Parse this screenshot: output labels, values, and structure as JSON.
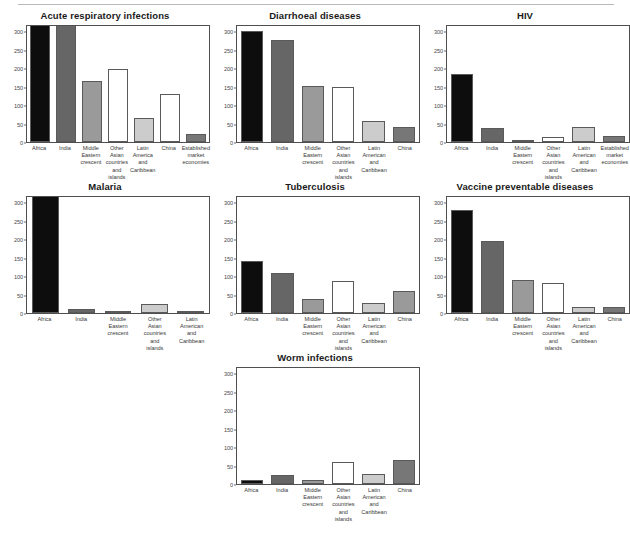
{
  "figure": {
    "title_rule": true,
    "panel_count": 7,
    "y_ticks": [
      0,
      50,
      100,
      150,
      200,
      250,
      300
    ],
    "y_axis_max": 320,
    "bar_colors": {
      "africa": "#0d0d0d",
      "india": "#666666",
      "middle_eastern": "#9a9a9a",
      "other_asian": "#ffffff",
      "latin_american": "#cccccc",
      "china": "#ffffff",
      "established": "#777777",
      "border": "#5a5a5a"
    }
  },
  "chart_data": [
    {
      "type": "bar",
      "title": "Acute respiratory infections",
      "xlabel": "",
      "ylabel": "",
      "ylim": [
        0,
        320
      ],
      "grid": false,
      "legend": "none",
      "categories": [
        "Africa",
        "India",
        "Middle Eastern crescent",
        "Other Asian countries and islands",
        "Latin America and Caribbean",
        "China",
        "Established market economies"
      ],
      "category_lines": [
        [
          "Africa"
        ],
        [
          "India"
        ],
        [
          "Middle",
          "Eastern",
          "crescent"
        ],
        [
          "Other",
          "Asian",
          "countries",
          "and",
          "islands"
        ],
        [
          "Latin",
          "America",
          "and",
          "Caribbean"
        ],
        [
          "China"
        ],
        [
          "Established",
          "market",
          "economies"
        ]
      ],
      "values": [
        318,
        318,
        165,
        199,
        64,
        129,
        22
      ],
      "colors": [
        "#0d0d0d",
        "#666666",
        "#9a9a9a",
        "#ffffff",
        "#cccccc",
        "#ffffff",
        "#777777"
      ]
    },
    {
      "type": "bar",
      "title": "Diarrhoeal diseases",
      "xlabel": "",
      "ylabel": "",
      "ylim": [
        0,
        320
      ],
      "grid": false,
      "legend": "none",
      "categories": [
        "Africa",
        "India",
        "Middle Eastern crescent",
        "Other Asian countries and islands",
        "Latin American and Caribbean",
        "China"
      ],
      "category_lines": [
        [
          "Africa"
        ],
        [
          "India"
        ],
        [
          "Middle",
          "Eastern",
          "crescent"
        ],
        [
          "Other",
          "Asian",
          "countries",
          "and",
          "islands"
        ],
        [
          "Latin",
          "American",
          "and",
          "Caribbean"
        ],
        [
          "China"
        ]
      ],
      "values": [
        302,
        276,
        153,
        148,
        57,
        41
      ],
      "colors": [
        "#0d0d0d",
        "#666666",
        "#9a9a9a",
        "#ffffff",
        "#cccccc",
        "#777777"
      ]
    },
    {
      "type": "bar",
      "title": "HIV",
      "xlabel": "",
      "ylabel": "",
      "ylim": [
        0,
        320
      ],
      "grid": false,
      "legend": "none",
      "categories": [
        "Africa",
        "India",
        "Middle Eastern crescent",
        "Other Asian countries and islands",
        "Latin American and Caribbean",
        "Established market economies"
      ],
      "category_lines": [
        [
          "Africa"
        ],
        [
          "India"
        ],
        [
          "Middle",
          "Eastern",
          "crescent"
        ],
        [
          "Other",
          "Asian",
          "countries",
          "and",
          "islands"
        ],
        [
          "Latin",
          "American",
          "and",
          "Caribbean"
        ],
        [
          "Established",
          "market",
          "economies"
        ]
      ],
      "values": [
        185,
        38,
        4,
        13,
        41,
        15
      ],
      "colors": [
        "#0d0d0d",
        "#666666",
        "#9a9a9a",
        "#ffffff",
        "#cccccc",
        "#777777"
      ]
    },
    {
      "type": "bar",
      "title": "Malaria",
      "xlabel": "",
      "ylabel": "",
      "ylim": [
        0,
        320
      ],
      "grid": false,
      "legend": "none",
      "categories": [
        "Africa",
        "India",
        "Middle Eastern crescent",
        "Other Asian countries and islands",
        "Latin American and Caribbean"
      ],
      "category_lines": [
        [
          "Africa"
        ],
        [
          "India"
        ],
        [
          "Middle",
          "Eastern",
          "crescent"
        ],
        [
          "Other",
          "Asian",
          "countries",
          "and",
          "islands"
        ],
        [
          "Latin",
          "American",
          "and",
          "Caribbean"
        ]
      ],
      "values": [
        318,
        10,
        3,
        24,
        5
      ],
      "colors": [
        "#0d0d0d",
        "#666666",
        "#9a9a9a",
        "#cccccc",
        "#777777"
      ]
    },
    {
      "type": "bar",
      "title": "Tuberculosis",
      "xlabel": "",
      "ylabel": "",
      "ylim": [
        0,
        320
      ],
      "grid": false,
      "legend": "none",
      "categories": [
        "Africa",
        "India",
        "Middle Eastern crescent",
        "Other Asian countries and islands",
        "Latin American and Caribbean",
        "China"
      ],
      "category_lines": [
        [
          "Africa"
        ],
        [
          "India"
        ],
        [
          "Middle",
          "Eastern",
          "crescent"
        ],
        [
          "Other",
          "Asian",
          "countries",
          "and",
          "islands"
        ],
        [
          "Latin",
          "American",
          "and",
          "Caribbean"
        ],
        [
          "China"
        ]
      ],
      "values": [
        142,
        109,
        39,
        87,
        27,
        59
      ],
      "colors": [
        "#0d0d0d",
        "#666666",
        "#9a9a9a",
        "#ffffff",
        "#cccccc",
        "#9a9a9a"
      ]
    },
    {
      "type": "bar",
      "title": "Vaccine preventable diseases",
      "xlabel": "",
      "ylabel": "",
      "ylim": [
        0,
        320
      ],
      "grid": false,
      "legend": "none",
      "categories": [
        "Africa",
        "India",
        "Middle Eastern crescent",
        "Other Asian countries and islands",
        "Latin American and Caribbean",
        "China"
      ],
      "category_lines": [
        [
          "Africa"
        ],
        [
          "India"
        ],
        [
          "Middle",
          "Eastern",
          "crescent"
        ],
        [
          "Other",
          "Asian",
          "countries",
          "and",
          "islands"
        ],
        [
          "Latin",
          "American",
          "and",
          "Caribbean"
        ],
        [
          "China"
        ]
      ],
      "values": [
        280,
        195,
        89,
        81,
        15,
        17
      ],
      "colors": [
        "#0d0d0d",
        "#666666",
        "#9a9a9a",
        "#ffffff",
        "#cccccc",
        "#777777"
      ]
    },
    {
      "type": "bar",
      "title": "Worm infections",
      "xlabel": "",
      "ylabel": "",
      "ylim": [
        0,
        320
      ],
      "grid": false,
      "legend": "none",
      "categories": [
        "Africa",
        "India",
        "Middle Eastern crescent",
        "Other Asian countries and islands",
        "Latin American and Caribbean",
        "China"
      ],
      "category_lines": [
        [
          "Africa"
        ],
        [
          "India"
        ],
        [
          "Middle",
          "Eastern",
          "crescent"
        ],
        [
          "Other",
          "Asian",
          "countries",
          "and",
          "islands"
        ],
        [
          "Latin",
          "American",
          "and",
          "Caribbean"
        ],
        [
          "China"
        ]
      ],
      "values": [
        11,
        24,
        10,
        60,
        28,
        64
      ],
      "colors": [
        "#0d0d0d",
        "#666666",
        "#9a9a9a",
        "#ffffff",
        "#cccccc",
        "#777777"
      ]
    }
  ]
}
